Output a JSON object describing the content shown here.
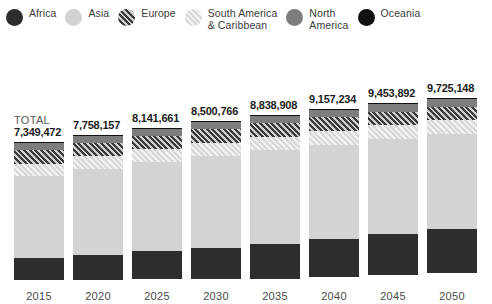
{
  "legend": {
    "items": [
      {
        "label": "Africa",
        "key": "africa",
        "swatch": "circle-swatch-africa"
      },
      {
        "label": "Asia",
        "key": "asia",
        "swatch": "circle-swatch-asia"
      },
      {
        "label": "Europe",
        "key": "europe",
        "swatch": "circle-swatch-europe"
      },
      {
        "label": "South America\n& Caribbean",
        "key": "southamerica",
        "swatch": "circle-swatch-south-america"
      },
      {
        "label": "North\nAmerica",
        "key": "northamerica",
        "swatch": "circle-swatch-north-america"
      },
      {
        "label": "Oceania",
        "key": "oceania",
        "swatch": "circle-swatch-oceania"
      }
    ]
  },
  "total_label": "TOTAL",
  "colors": {
    "africa": "#2d2d2d",
    "asia": "#d3d3d3",
    "europe": "#3a3a3a",
    "south_america": "#e6e6e6",
    "north_america": "#7d7d7d",
    "oceania": "#111111",
    "text": "#3f3f3f",
    "total_number": "#1c1c1c"
  },
  "chart_data": {
    "type": "bar",
    "subtype": "stacked",
    "title": "",
    "xlabel": "",
    "ylabel": "",
    "grid": false,
    "legend_position": "top",
    "categories": [
      "2015",
      "2020",
      "2025",
      "2030",
      "2035",
      "2040",
      "2045",
      "2050"
    ],
    "totals": [
      7349472,
      7758157,
      8141661,
      8500766,
      8838908,
      9157234,
      9453892,
      9725148
    ],
    "totals_formatted": [
      "7,349,472",
      "7,758,157",
      "8,141,661",
      "8,500,766",
      "8,838,908",
      "9,157,234",
      "9,453,892",
      "9,725,148"
    ],
    "stack_order_bottom_to_top": [
      "Africa",
      "Asia",
      "South America & Caribbean",
      "Europe",
      "North America",
      "Oceania"
    ],
    "series": [
      {
        "name": "Africa",
        "key": "africa",
        "values": [
          1186178,
          1340598,
          1508935,
          1679268,
          1851298,
          2021026,
          2186452,
          2345532
        ]
      },
      {
        "name": "Asia",
        "key": "asia",
        "values": [
          4393296,
          4581757,
          4742265,
          4886786,
          4996958,
          5069453,
          5105492,
          5108296
        ]
      },
      {
        "name": "Europe",
        "key": "europe",
        "values": [
          738442,
          740813,
          739456,
          734039,
          724834,
          712128,
          696199,
          677254
        ]
      },
      {
        "name": "South America & Caribbean",
        "key": "southamerica",
        "values": [
          632381,
          666483,
          695486,
          718483,
          734955,
          744217,
          746072,
          741467
        ]
      },
      {
        "name": "North America",
        "key": "northamerica",
        "values": [
          357838,
          369541,
          381242,
          392357,
          402419,
          411164,
          418722,
          425200
        ]
      },
      {
        "name": "Oceania",
        "key": "oceania",
        "values": [
          39331,
          42965,
          46277,
          49333,
          52144,
          54746,
          57155,
          59399
        ]
      }
    ],
    "units": "people",
    "ylim": [
      0,
      9725148
    ]
  }
}
